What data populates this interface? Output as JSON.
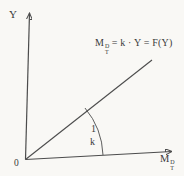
{
  "figure": {
    "labels": {
      "y_axis": "Y",
      "origin": "0",
      "x_axis": {
        "base": "M",
        "sup": "D",
        "sub": "T"
      },
      "equation": {
        "base": "M",
        "sup": "D",
        "sub": "T",
        "rest": "= k · Y = F(Y)"
      },
      "slope_numerator": "1",
      "slope_denominator": "k"
    },
    "colors": {
      "background": "#f9f8f5",
      "line": "#4c4c4c",
      "text": "#3a3a3a"
    }
  }
}
